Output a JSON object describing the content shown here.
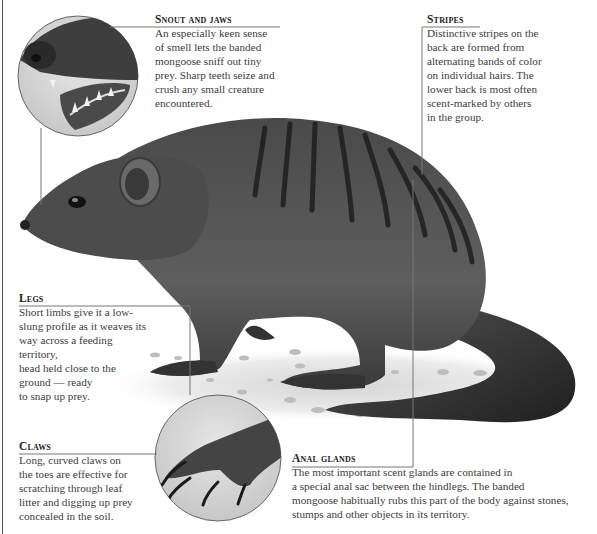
{
  "callouts": {
    "snout": {
      "heading": "Snout and jaws",
      "lines": [
        "An especially keen sense",
        "of smell lets the banded",
        "mongoose sniff out tiny",
        "prey. Sharp teeth seize and",
        "crush any small creature",
        "encountered."
      ]
    },
    "stripes": {
      "heading": "Stripes",
      "lines": [
        "Distinctive stripes on the",
        "back are formed from",
        "alternating bands of color",
        "on individual hairs. The",
        "lower back is most often",
        "scent-marked by others",
        "in the group."
      ]
    },
    "legs": {
      "heading": "Legs",
      "lines": [
        "Short limbs give it a low-",
        "slung profile as it weaves its",
        "way across a feeding territory,",
        "head held close to the",
        "ground — ready",
        "to snap up prey."
      ]
    },
    "claws": {
      "heading": "Claws",
      "lines": [
        "Long, curved claws on",
        "the toes are effective for",
        "scratching through leaf",
        "litter and digging up prey",
        "concealed in the soil."
      ]
    },
    "anal": {
      "heading": "Anal glands",
      "lines": [
        "The most important scent glands are contained in",
        "a special anal sac between the hindlegs. The banded",
        "mongoose habitually rubs this part of the body against stones,",
        "stumps and other objects in its territory."
      ]
    }
  },
  "colors": {
    "fur_dark": "#2e2e2e",
    "fur_mid": "#5a5a5a",
    "fur_light": "#8a8a8a",
    "circle_bg": "#d9d9d9",
    "leader_line": "#777777",
    "ground": "#e8e8e8"
  }
}
